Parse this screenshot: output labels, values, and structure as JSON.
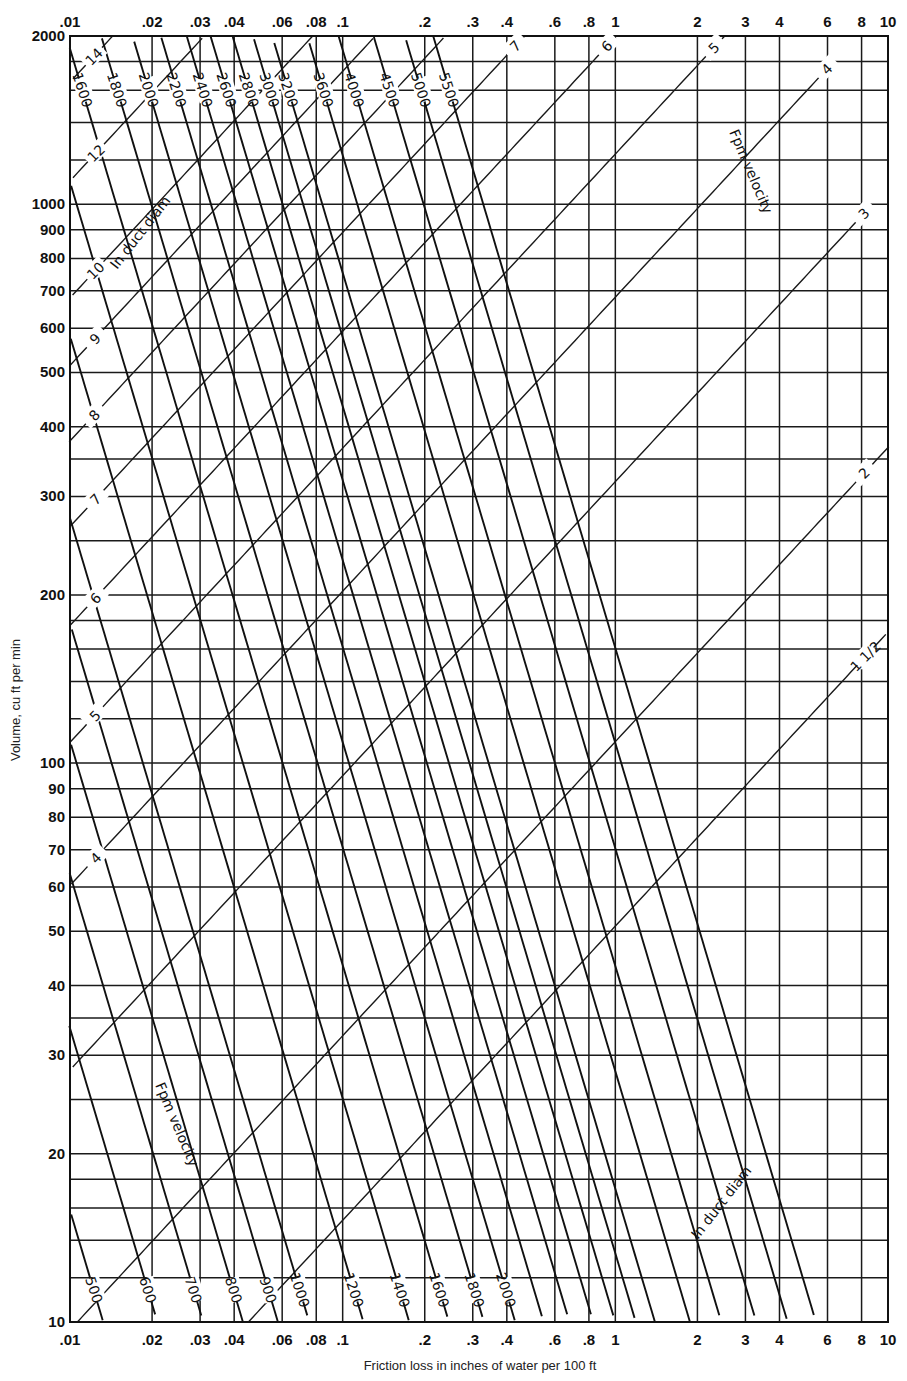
{
  "chart_data": {
    "type": "line",
    "title": "",
    "xlabel": "Friction loss in inches of water per 100 ft",
    "ylabel": "Volume, cu ft per min",
    "x_scale": "log",
    "y_scale": "log",
    "xlim": [
      0.01,
      10
    ],
    "ylim": [
      10,
      2000
    ],
    "grid": true,
    "x_tick_labels": [
      ".01",
      ".02",
      ".03",
      ".04",
      ".06",
      ".08",
      ".1",
      ".2",
      ".3",
      ".4",
      ".6",
      ".8",
      "1",
      "2",
      "3",
      "4",
      "6",
      "8",
      "10"
    ],
    "x_ticks": [
      0.01,
      0.02,
      0.03,
      0.04,
      0.06,
      0.08,
      0.1,
      0.2,
      0.3,
      0.4,
      0.6,
      0.8,
      1,
      2,
      3,
      4,
      6,
      8,
      10
    ],
    "y_tick_labels": [
      "10",
      "20",
      "30",
      "40",
      "50",
      "60",
      "70",
      "80",
      "90",
      "100",
      "200",
      "300",
      "400",
      "500",
      "600",
      "700",
      "800",
      "900",
      "1000",
      "2000"
    ],
    "y_ticks": [
      10,
      20,
      30,
      40,
      50,
      60,
      70,
      80,
      90,
      100,
      200,
      300,
      400,
      500,
      600,
      700,
      800,
      900,
      1000,
      2000
    ],
    "y_minor_gridlines": [
      12,
      14,
      16,
      18,
      25,
      35,
      120,
      140,
      160,
      180,
      250,
      350,
      1200,
      1400,
      1600,
      1800
    ],
    "series": [
      {
        "name": "Duct diameter (in)",
        "group": "diameter",
        "annotation": "In duct diam",
        "values": [
          "1 1/2",
          "2",
          "3",
          "4",
          "5",
          "6",
          "7",
          "8",
          "9",
          "10",
          "12",
          "14",
          "16",
          "18",
          "20",
          "22",
          "24"
        ]
      },
      {
        "name": "Velocity (fpm)",
        "group": "velocity",
        "annotation": "Fpm velocity",
        "values": [
          200,
          300,
          400,
          500,
          600,
          700,
          800,
          900,
          1000,
          1200,
          1400,
          1600,
          1800,
          2000,
          2200,
          2400,
          2600,
          2800,
          3000,
          3200,
          3600,
          4000,
          4500,
          5000,
          5500
        ]
      }
    ],
    "annotations": [
      "In duct diam",
      "Fpm velocity",
      "In duct diam",
      "Fpm velocity"
    ]
  },
  "labels": {
    "xlabel": "Friction loss in inches of water per 100 ft",
    "ylabel": "Volume, cu ft per min",
    "diam_annot": "In duct diam",
    "vel_annot": "Fpm velocity"
  }
}
